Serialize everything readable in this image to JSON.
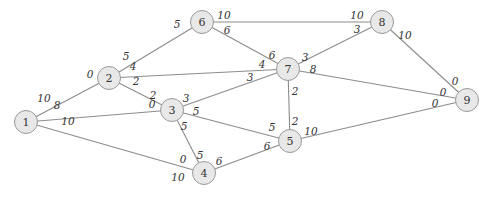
{
  "diagram": {
    "type": "weighted-graph",
    "nodes": [
      {
        "id": "1",
        "x": 26,
        "y": 122
      },
      {
        "id": "2",
        "x": 109,
        "y": 78
      },
      {
        "id": "3",
        "x": 172,
        "y": 110
      },
      {
        "id": "4",
        "x": 204,
        "y": 173
      },
      {
        "id": "5",
        "x": 290,
        "y": 141
      },
      {
        "id": "6",
        "x": 202,
        "y": 22
      },
      {
        "id": "7",
        "x": 288,
        "y": 69
      },
      {
        "id": "8",
        "x": 382,
        "y": 22
      },
      {
        "id": "9",
        "x": 467,
        "y": 100
      }
    ],
    "edges": [
      {
        "from": "1",
        "to": "2",
        "w_from": "10",
        "w_to": "0",
        "lf": [
          44,
          98
        ],
        "lt": [
          90,
          74
        ]
      },
      {
        "from": "1",
        "to": "3",
        "w_from": "8",
        "w_to": "0",
        "lf": [
          57,
          105
        ],
        "lt": [
          152,
          104
        ]
      },
      {
        "from": "1",
        "to": "4",
        "w_from": "10",
        "w_to": "10",
        "lf": [
          68,
          121
        ],
        "lt": [
          178,
          177
        ]
      },
      {
        "from": "2",
        "to": "6",
        "w_from": "5",
        "w_to": "5",
        "lf": [
          126,
          56
        ],
        "lt": [
          177,
          24
        ]
      },
      {
        "from": "2",
        "to": "7",
        "w_from": "4",
        "w_to": "4",
        "lf": [
          133,
          66
        ],
        "lt": [
          262,
          64
        ]
      },
      {
        "from": "2",
        "to": "3",
        "w_from": "2",
        "w_to": "2",
        "lf": [
          136,
          81
        ],
        "lt": [
          153,
          95
        ]
      },
      {
        "from": "3",
        "to": "7",
        "w_from": "3",
        "w_to": "3",
        "lf": [
          186,
          98
        ],
        "lt": [
          250,
          77
        ]
      },
      {
        "from": "3",
        "to": "5",
        "w_from": "5",
        "w_to": "5",
        "lf": [
          196,
          111
        ],
        "lt": [
          272,
          127
        ]
      },
      {
        "from": "3",
        "to": "4",
        "w_from": "5",
        "w_to": "5",
        "lf": [
          184,
          126
        ],
        "lt": [
          200,
          155
        ]
      },
      {
        "from": "4",
        "to": "3",
        "w_from": "0",
        "w_to": "",
        "lf": [
          183,
          159
        ],
        "lt": [
          0,
          0
        ]
      },
      {
        "from": "4",
        "to": "5",
        "w_from": "6",
        "w_to": "6",
        "lf": [
          219,
          161
        ],
        "lt": [
          267,
          146
        ]
      },
      {
        "from": "6",
        "to": "8",
        "w_from": "10",
        "w_to": "10",
        "lf": [
          224,
          15
        ],
        "lt": [
          357,
          15
        ]
      },
      {
        "from": "6",
        "to": "7",
        "w_from": "6",
        "w_to": "6",
        "lf": [
          227,
          30
        ],
        "lt": [
          272,
          55
        ]
      },
      {
        "from": "7",
        "to": "8",
        "w_from": "3",
        "w_to": "3",
        "lf": [
          305,
          57
        ],
        "lt": [
          357,
          29
        ]
      },
      {
        "from": "7",
        "to": "9",
        "w_from": "8",
        "w_to": "0",
        "lf": [
          313,
          69
        ],
        "lt": [
          443,
          92
        ]
      },
      {
        "from": "7",
        "to": "5",
        "w_from": "2",
        "w_to": "2",
        "lf": [
          295,
          91
        ],
        "lt": [
          295,
          121
        ]
      },
      {
        "from": "8",
        "to": "9",
        "w_from": "10",
        "w_to": "0",
        "lf": [
          405,
          35
        ],
        "lt": [
          455,
          81
        ]
      },
      {
        "from": "5",
        "to": "9",
        "w_from": "10",
        "w_to": "0",
        "lf": [
          311,
          131
        ],
        "lt": [
          435,
          103
        ]
      }
    ]
  }
}
